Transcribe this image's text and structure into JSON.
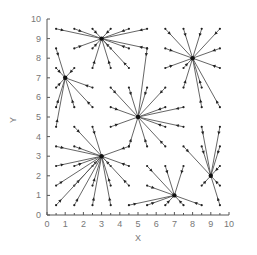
{
  "chart_data": {
    "type": "vector-field",
    "title": "",
    "xlabel": "X",
    "ylabel": "Y",
    "xlim": [
      0,
      10
    ],
    "ylim": [
      0,
      10
    ],
    "xticks": [
      0,
      1,
      2,
      3,
      4,
      5,
      6,
      7,
      8,
      9,
      10
    ],
    "yticks": [
      0,
      1,
      2,
      3,
      4,
      5,
      6,
      7,
      8,
      9,
      10
    ],
    "grid": false,
    "legend": null,
    "centers": [
      {
        "x": 3,
        "y": 9
      },
      {
        "x": 8,
        "y": 8
      },
      {
        "x": 1,
        "y": 7
      },
      {
        "x": 5,
        "y": 5
      },
      {
        "x": 3,
        "y": 3
      },
      {
        "x": 7,
        "y": 1
      },
      {
        "x": 9,
        "y": 2
      }
    ],
    "vectors": [
      {
        "from": [
          0.5,
          9.5
        ],
        "to": [
          3,
          9
        ]
      },
      {
        "from": [
          1.5,
          9.5
        ],
        "to": [
          3,
          9
        ]
      },
      {
        "from": [
          2.5,
          9.5
        ],
        "to": [
          3,
          9
        ]
      },
      {
        "from": [
          3.5,
          9.5
        ],
        "to": [
          3,
          9
        ]
      },
      {
        "from": [
          4.5,
          9.5
        ],
        "to": [
          3,
          9
        ]
      },
      {
        "from": [
          5.5,
          9.5
        ],
        "to": [
          3,
          9
        ]
      },
      {
        "from": [
          1.5,
          8.5
        ],
        "to": [
          3,
          9
        ]
      },
      {
        "from": [
          2.5,
          8.5
        ],
        "to": [
          3,
          9
        ]
      },
      {
        "from": [
          3.5,
          8.5
        ],
        "to": [
          3,
          9
        ]
      },
      {
        "from": [
          4.5,
          8.5
        ],
        "to": [
          3,
          9
        ]
      },
      {
        "from": [
          5.5,
          8.5
        ],
        "to": [
          3,
          9
        ]
      },
      {
        "from": [
          2.5,
          7.5
        ],
        "to": [
          3,
          9
        ]
      },
      {
        "from": [
          3.5,
          7.5
        ],
        "to": [
          3,
          9
        ]
      },
      {
        "from": [
          4.5,
          7.5
        ],
        "to": [
          3,
          9
        ]
      },
      {
        "from": [
          6.5,
          9.5
        ],
        "to": [
          8,
          8
        ]
      },
      {
        "from": [
          7.5,
          9.5
        ],
        "to": [
          8,
          8
        ]
      },
      {
        "from": [
          8.5,
          9.5
        ],
        "to": [
          8,
          8
        ]
      },
      {
        "from": [
          9.5,
          9.5
        ],
        "to": [
          8,
          8
        ]
      },
      {
        "from": [
          6.5,
          8.5
        ],
        "to": [
          8,
          8
        ]
      },
      {
        "from": [
          9.5,
          8.5
        ],
        "to": [
          8,
          8
        ]
      },
      {
        "from": [
          6.5,
          7.5
        ],
        "to": [
          8,
          8
        ]
      },
      {
        "from": [
          7.5,
          7.5
        ],
        "to": [
          8,
          8
        ]
      },
      {
        "from": [
          9.5,
          7.5
        ],
        "to": [
          8,
          8
        ]
      },
      {
        "from": [
          7.5,
          6.5
        ],
        "to": [
          8,
          8
        ]
      },
      {
        "from": [
          8.5,
          6.5
        ],
        "to": [
          8,
          8
        ]
      },
      {
        "from": [
          8.5,
          5.5
        ],
        "to": [
          8,
          8
        ]
      },
      {
        "from": [
          9.5,
          5.5
        ],
        "to": [
          8,
          8
        ]
      },
      {
        "from": [
          0.5,
          8.5
        ],
        "to": [
          1,
          7
        ]
      },
      {
        "from": [
          1.5,
          7.5
        ],
        "to": [
          1,
          7
        ]
      },
      {
        "from": [
          0.5,
          7.5
        ],
        "to": [
          1,
          7
        ]
      },
      {
        "from": [
          2.5,
          6.5
        ],
        "to": [
          1,
          7
        ]
      },
      {
        "from": [
          0.5,
          6.5
        ],
        "to": [
          1,
          7
        ]
      },
      {
        "from": [
          0.5,
          5.5
        ],
        "to": [
          1,
          7
        ]
      },
      {
        "from": [
          1.5,
          5.5
        ],
        "to": [
          1,
          7
        ]
      },
      {
        "from": [
          2.5,
          5.5
        ],
        "to": [
          1,
          7
        ]
      },
      {
        "from": [
          0.5,
          4.5
        ],
        "to": [
          1,
          7
        ]
      },
      {
        "from": [
          3.5,
          6.5
        ],
        "to": [
          5,
          5
        ]
      },
      {
        "from": [
          4.5,
          6.5
        ],
        "to": [
          5,
          5
        ]
      },
      {
        "from": [
          5.5,
          6.5
        ],
        "to": [
          5,
          5
        ]
      },
      {
        "from": [
          6.5,
          6.5
        ],
        "to": [
          5,
          5
        ]
      },
      {
        "from": [
          3.5,
          5.5
        ],
        "to": [
          5,
          5
        ]
      },
      {
        "from": [
          6.5,
          5.5
        ],
        "to": [
          5,
          5
        ]
      },
      {
        "from": [
          7.5,
          5.5
        ],
        "to": [
          5,
          5
        ]
      },
      {
        "from": [
          3.5,
          4.5
        ],
        "to": [
          5,
          5
        ]
      },
      {
        "from": [
          6.5,
          4.5
        ],
        "to": [
          5,
          5
        ]
      },
      {
        "from": [
          7.5,
          4.5
        ],
        "to": [
          5,
          5
        ]
      },
      {
        "from": [
          4.5,
          3.5
        ],
        "to": [
          5,
          5
        ]
      },
      {
        "from": [
          5.5,
          3.5
        ],
        "to": [
          5,
          5
        ]
      },
      {
        "from": [
          6.5,
          3.5
        ],
        "to": [
          5,
          5
        ]
      },
      {
        "from": [
          5.5,
          8.5
        ],
        "to": [
          5,
          5
        ]
      },
      {
        "from": [
          1.5,
          4.5
        ],
        "to": [
          3,
          3
        ]
      },
      {
        "from": [
          2.5,
          4.5
        ],
        "to": [
          3,
          3
        ]
      },
      {
        "from": [
          0.5,
          3.5
        ],
        "to": [
          3,
          3
        ]
      },
      {
        "from": [
          1.5,
          3.5
        ],
        "to": [
          3,
          3
        ]
      },
      {
        "from": [
          4.5,
          3.5
        ],
        "to": [
          3,
          3
        ]
      },
      {
        "from": [
          0.5,
          2.5
        ],
        "to": [
          3,
          3
        ]
      },
      {
        "from": [
          1.5,
          2.5
        ],
        "to": [
          3,
          3
        ]
      },
      {
        "from": [
          2.5,
          2.5
        ],
        "to": [
          3,
          3
        ]
      },
      {
        "from": [
          3.5,
          2.5
        ],
        "to": [
          3,
          3
        ]
      },
      {
        "from": [
          4.5,
          2.5
        ],
        "to": [
          3,
          3
        ]
      },
      {
        "from": [
          0.5,
          1.5
        ],
        "to": [
          3,
          3
        ]
      },
      {
        "from": [
          1.5,
          1.5
        ],
        "to": [
          3,
          3
        ]
      },
      {
        "from": [
          2.5,
          1.5
        ],
        "to": [
          3,
          3
        ]
      },
      {
        "from": [
          3.5,
          1.5
        ],
        "to": [
          3,
          3
        ]
      },
      {
        "from": [
          4.5,
          1.5
        ],
        "to": [
          3,
          3
        ]
      },
      {
        "from": [
          0.5,
          0.5
        ],
        "to": [
          3,
          3
        ]
      },
      {
        "from": [
          1.5,
          0.5
        ],
        "to": [
          3,
          3
        ]
      },
      {
        "from": [
          2.5,
          0.5
        ],
        "to": [
          3,
          3
        ]
      },
      {
        "from": [
          3.5,
          0.5
        ],
        "to": [
          3,
          3
        ]
      },
      {
        "from": [
          5.5,
          2.5
        ],
        "to": [
          7,
          1
        ]
      },
      {
        "from": [
          6.5,
          2.5
        ],
        "to": [
          7,
          1
        ]
      },
      {
        "from": [
          7.5,
          2.5
        ],
        "to": [
          7,
          1
        ]
      },
      {
        "from": [
          5.5,
          1.5
        ],
        "to": [
          7,
          1
        ]
      },
      {
        "from": [
          4.5,
          0.5
        ],
        "to": [
          7,
          1
        ]
      },
      {
        "from": [
          5.5,
          0.5
        ],
        "to": [
          7,
          1
        ]
      },
      {
        "from": [
          6.5,
          0.5
        ],
        "to": [
          7,
          1
        ]
      },
      {
        "from": [
          7.5,
          0.5
        ],
        "to": [
          7,
          1
        ]
      },
      {
        "from": [
          8.5,
          0.5
        ],
        "to": [
          7,
          1
        ]
      },
      {
        "from": [
          8.5,
          4.5
        ],
        "to": [
          9,
          2
        ]
      },
      {
        "from": [
          9.5,
          4.5
        ],
        "to": [
          9,
          2
        ]
      },
      {
        "from": [
          7.5,
          3.5
        ],
        "to": [
          9,
          2
        ]
      },
      {
        "from": [
          8.5,
          3.5
        ],
        "to": [
          9,
          2
        ]
      },
      {
        "from": [
          9.5,
          3.5
        ],
        "to": [
          9,
          2
        ]
      },
      {
        "from": [
          9.5,
          2.5
        ],
        "to": [
          9,
          2
        ]
      },
      {
        "from": [
          8.5,
          1.5
        ],
        "to": [
          9,
          2
        ]
      },
      {
        "from": [
          9.5,
          1.5
        ],
        "to": [
          9,
          2
        ]
      },
      {
        "from": [
          9.5,
          0.5
        ],
        "to": [
          9,
          2
        ]
      }
    ]
  }
}
